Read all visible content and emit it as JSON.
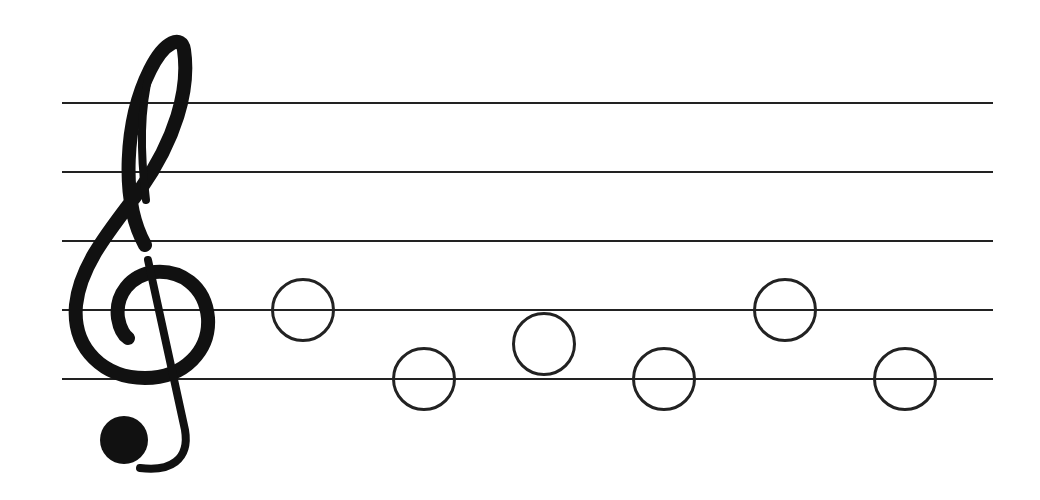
{
  "diagram": {
    "type": "music-staff",
    "clef": {
      "name": "treble-clef",
      "glyph": "G clef"
    },
    "staff": {
      "x_start": 62,
      "x_end": 993,
      "line_ys": [
        103,
        172,
        241,
        310,
        379
      ],
      "line_color": "#222222"
    },
    "notes": [
      {
        "cx": 303,
        "cy": 310,
        "pitch": "G4",
        "type": "whole"
      },
      {
        "cx": 424,
        "cy": 379,
        "pitch": "E4",
        "type": "whole"
      },
      {
        "cx": 544,
        "cy": 344,
        "pitch": "F4",
        "type": "whole"
      },
      {
        "cx": 664,
        "cy": 379,
        "pitch": "E4",
        "type": "whole"
      },
      {
        "cx": 785,
        "cy": 310,
        "pitch": "G4",
        "type": "whole"
      },
      {
        "cx": 905,
        "cy": 379,
        "pitch": "E4",
        "type": "whole"
      }
    ],
    "note_radius": 32,
    "note_color": "#222222"
  }
}
